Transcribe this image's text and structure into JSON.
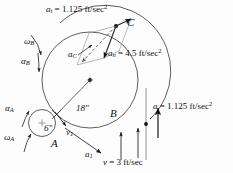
{
  "figure": {
    "background_color": "#fdfdfd",
    "ink_color": "#111111",
    "labels": {
      "a_t": {
        "symbol": "a",
        "subscript": "t",
        "equals": "= 1.125 ft/sec",
        "exponent": "2",
        "full_text": "a_t = 1.125 ft/sec^2"
      },
      "a_n": {
        "symbol": "a",
        "subscript": "n",
        "equals": "= 4.5 ft/sec",
        "exponent": "2",
        "full_text": "a_n = 4.5 ft/sec^2"
      },
      "a_right": {
        "symbol": "a",
        "subscript": "",
        "equals": "= 1.125 ft/sec",
        "exponent": "2",
        "full_text": "a = 1.125 ft/sec^2"
      },
      "v_bottom": {
        "symbol": "v",
        "subscript": "",
        "equals": "= 3 ft/sec",
        "exponent": "",
        "full_text": "v = 3 ft/sec"
      },
      "a_C": {
        "symbol": "a",
        "subscript": "C"
      },
      "a_1": {
        "symbol": "a",
        "subscript": "1"
      },
      "v_1": {
        "symbol": "v",
        "subscript": "1"
      },
      "omega_B": {
        "symbol": "ω",
        "subscript": "B"
      },
      "alpha_B": {
        "symbol": "α",
        "subscript": "B"
      },
      "omega_A": {
        "symbol": "ω",
        "subscript": "A"
      },
      "alpha_A": {
        "symbol": "α",
        "subscript": "A"
      },
      "point_A": "A",
      "point_B": "B",
      "point_C": "C",
      "radius_B": "18″",
      "radius_A": "6″"
    }
  }
}
